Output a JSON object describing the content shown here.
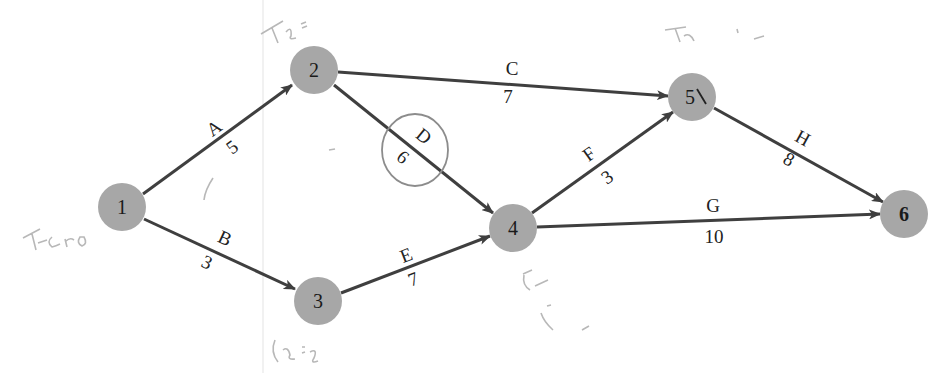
{
  "diagram": {
    "type": "activity-on-arrow network",
    "colors": {
      "node_fill": "#a7a7a7",
      "edge": "#3f3f3f",
      "label": "#222222",
      "pencil": "#bdbdbd"
    },
    "nodes": [
      {
        "id": "1",
        "label": "1",
        "x": 122,
        "y": 207
      },
      {
        "id": "2",
        "label": "2",
        "x": 314,
        "y": 70
      },
      {
        "id": "3",
        "label": "3",
        "x": 318,
        "y": 301
      },
      {
        "id": "4",
        "label": "4",
        "x": 513,
        "y": 228
      },
      {
        "id": "5",
        "label": "5",
        "x": 692,
        "y": 97
      },
      {
        "id": "6",
        "label": "6",
        "x": 904,
        "y": 214
      }
    ],
    "edges": [
      {
        "activity": "A",
        "duration": "5",
        "from": "1",
        "to": "2"
      },
      {
        "activity": "B",
        "duration": "3",
        "from": "1",
        "to": "3"
      },
      {
        "activity": "C",
        "duration": "7",
        "from": "2",
        "to": "5"
      },
      {
        "activity": "D",
        "duration": "6",
        "from": "2",
        "to": "4",
        "circled": true
      },
      {
        "activity": "E",
        "duration": "7",
        "from": "3",
        "to": "4"
      },
      {
        "activity": "F",
        "duration": "3",
        "from": "4",
        "to": "5"
      },
      {
        "activity": "G",
        "duration": "10",
        "from": "4",
        "to": "6"
      },
      {
        "activity": "H",
        "duration": "8",
        "from": "5",
        "to": "6"
      }
    ],
    "annotations": [
      {
        "text": "TE = 5",
        "near": "node-2"
      },
      {
        "text": "TE = ...",
        "near": "node-5"
      },
      {
        "text": "TE = 3",
        "near": "node-3"
      },
      {
        "text": "TE ...",
        "near": "node-4"
      },
      {
        "text": "Zero",
        "near": "node-1"
      }
    ]
  }
}
